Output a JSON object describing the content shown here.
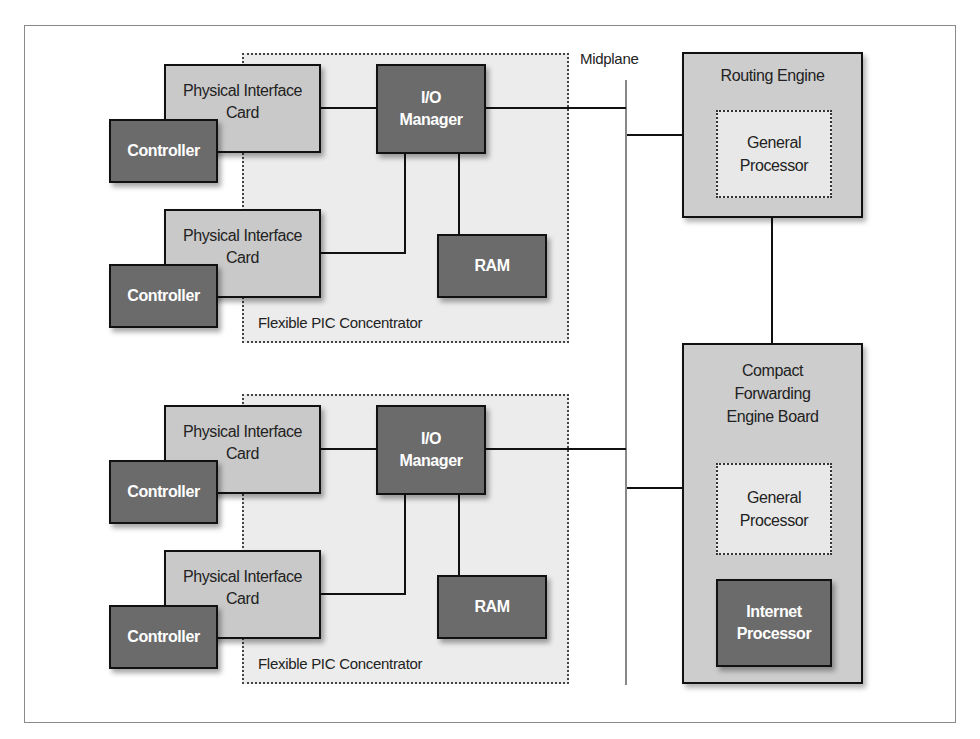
{
  "diagram": {
    "type": "hardware architecture block diagram",
    "midplane": {
      "label": "Midplane"
    },
    "fpc_modules": [
      {
        "label": "Flexible PIC Concentrator",
        "io_manager": "I/O\nManager",
        "ram": "RAM",
        "pics": [
          {
            "card": "Physical Interface\nCard",
            "controller": "Controller"
          },
          {
            "card": "Physical Interface\nCard",
            "controller": "Controller"
          }
        ]
      },
      {
        "label": "Flexible PIC Concentrator",
        "io_manager": "I/O\nManager",
        "ram": "RAM",
        "pics": [
          {
            "card": "Physical Interface\nCard",
            "controller": "Controller"
          },
          {
            "card": "Physical Interface\nCard",
            "controller": "Controller"
          }
        ]
      }
    ],
    "routing_engine": {
      "title": "Routing Engine",
      "general_processor": "General\nProcessor"
    },
    "cfeb": {
      "title": "Compact\nForwarding\nEngine Board",
      "general_processor": "General\nProcessor",
      "internet_processor": "Internet\nProcessor"
    },
    "colors": {
      "dark_box": "#6b6b6b",
      "light_box": "#c9c9c9",
      "fpc_background": "#ececec",
      "border": "#111111"
    }
  }
}
